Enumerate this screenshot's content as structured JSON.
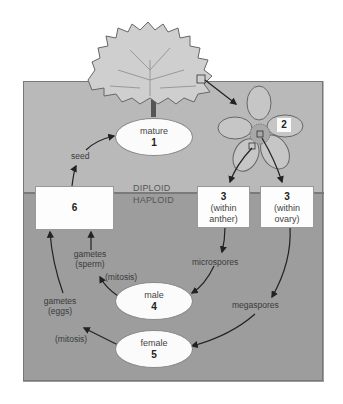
{
  "diagram": {
    "type": "plant life cycle (alternation of generations)",
    "zones": {
      "upper": "DIPLOID",
      "lower": "HAPLOID"
    },
    "stages": {
      "mature": {
        "name": "mature",
        "number": "1"
      },
      "flower": {
        "number": "2"
      },
      "anther": {
        "number": "3",
        "sub": "(within anther)"
      },
      "ovary": {
        "number": "3",
        "sub": "(within ovary)"
      },
      "male": {
        "name": "male",
        "number": "4"
      },
      "female": {
        "name": "female",
        "number": "5"
      },
      "zygote_box": {
        "number": "6"
      }
    },
    "arrow_labels": {
      "seed": "seed",
      "microspores": "microspores",
      "megaspores": "megaspores",
      "gametes_sperm_1": "gametes",
      "gametes_sperm_2": "(sperm)",
      "gametes_eggs_1": "gametes",
      "gametes_eggs_2": "(eggs)",
      "mitosis_male": "(mitosis)",
      "mitosis_female": "(mitosis)"
    },
    "colors": {
      "diploid_bg": "#b9b9b9",
      "haploid_bg": "#9d9d9d",
      "oval_fill": "#fbfbfb",
      "arrow": "#222222"
    }
  }
}
